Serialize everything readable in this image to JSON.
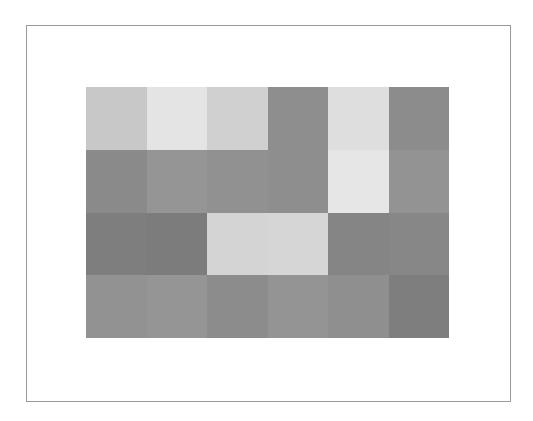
{
  "chart_data": {
    "type": "heatmap",
    "title": "",
    "xlabel": "",
    "ylabel": "",
    "rows": 4,
    "cols": 6,
    "colormap": "grayscale",
    "grid": false,
    "legend": null,
    "values": [
      [
        200,
        228,
        208,
        142,
        222,
        140
      ],
      [
        138,
        149,
        145,
        142,
        230,
        147
      ],
      [
        126,
        124,
        212,
        214,
        133,
        135
      ],
      [
        146,
        149,
        140,
        148,
        143,
        126
      ]
    ],
    "colors": [
      [
        "#c8c8c8",
        "#e4e4e4",
        "#d0d0d0",
        "#8e8e8e",
        "#dedede",
        "#8c8c8c"
      ],
      [
        "#8a8a8a",
        "#959595",
        "#919191",
        "#8e8e8e",
        "#e6e6e6",
        "#939393"
      ],
      [
        "#7e7e7e",
        "#7c7c7c",
        "#d4d4d4",
        "#d6d6d6",
        "#858585",
        "#878787"
      ],
      [
        "#929292",
        "#959595",
        "#8c8c8c",
        "#949494",
        "#8f8f8f",
        "#7e7e7e"
      ]
    ]
  },
  "frame": {
    "border_color": "#9a9a9a",
    "background": "#ffffff"
  }
}
